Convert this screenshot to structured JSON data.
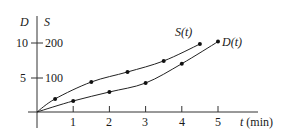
{
  "chart_data": {
    "type": "line",
    "title": "",
    "xlabel": "t (min)",
    "ylabel_left": "D",
    "ylabel_right": "S",
    "x_ticks": [
      1,
      2,
      3,
      4,
      5
    ],
    "y_ticks_left": [
      5,
      10
    ],
    "y_ticks_right": [
      100,
      200
    ],
    "xlim": [
      0,
      5.6
    ],
    "ylim_left": [
      0,
      11
    ],
    "ylim_right": [
      0,
      220
    ],
    "grid": false,
    "series": [
      {
        "name": "S(t)",
        "axis": "right",
        "x": [
          0,
          0.5,
          1.5,
          2.5,
          3.5,
          4.5
        ],
        "values": [
          0,
          38,
          87,
          116,
          148,
          197
        ]
      },
      {
        "name": "D(t)",
        "axis": "left",
        "x": [
          0,
          1,
          2,
          3,
          4,
          5
        ],
        "values": [
          0,
          1.6,
          2.9,
          4.2,
          7.0,
          10.2
        ]
      }
    ],
    "annotations": [
      "S(t)",
      "D(t)"
    ]
  },
  "labels": {
    "D": "D",
    "S": "S",
    "t_var": "t",
    "t_unit": " (min)",
    "S_name": "S(t)",
    "D_name": "D(t)",
    "y10": "10",
    "y5": "5",
    "y200": "200",
    "y100": "100",
    "x1": "1",
    "x2": "2",
    "x3": "3",
    "x4": "4",
    "x5": "5"
  }
}
